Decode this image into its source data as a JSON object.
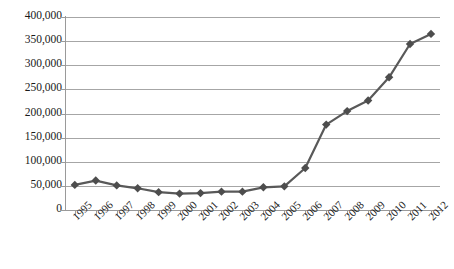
{
  "chart_data": {
    "type": "line",
    "title": "",
    "subtitle": "",
    "xlabel": "",
    "ylabel": "",
    "categories": [
      "1995",
      "1996",
      "1997",
      "1998",
      "1999",
      "2000",
      "2001",
      "2002",
      "2003",
      "2004",
      "2005",
      "2006",
      "2007",
      "2008",
      "2009",
      "2010",
      "2011",
      "2012"
    ],
    "series": [
      {
        "name": "",
        "values": [
          52000,
          61000,
          51000,
          45000,
          37000,
          34000,
          35000,
          38000,
          38000,
          47000,
          49000,
          87000,
          177000,
          205000,
          227000,
          275000,
          344000,
          365000
        ]
      }
    ],
    "ylim": [
      0,
      400000
    ],
    "yticks": [
      0,
      50000,
      100000,
      150000,
      200000,
      250000,
      300000,
      350000,
      400000
    ],
    "ytick_labels": [
      "0",
      "50,000",
      "100,000",
      "150,000",
      "200,000",
      "250,000",
      "300,000",
      "350,000",
      "400,000"
    ],
    "grid": true,
    "legend": "none",
    "marker": "diamond",
    "line_color": "#595959",
    "marker_color": "#4d4d4d",
    "grid_color": "#a6a6a6",
    "axis_color": "#9a9a9a",
    "background": "#ffffff",
    "x_tick_rotation": -45
  }
}
